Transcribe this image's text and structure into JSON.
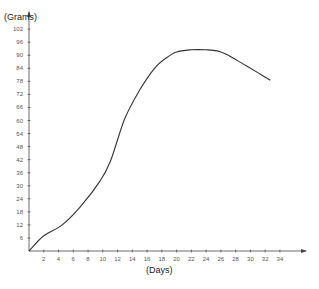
{
  "chart_data": {
    "type": "line",
    "title": "",
    "xlabel": "(Days)",
    "ylabel": "(Grams)",
    "xlim": [
      0,
      36
    ],
    "ylim": [
      0,
      104
    ],
    "grid": false,
    "legend": null,
    "x_ticks": [
      2,
      4,
      6,
      8,
      10,
      12,
      14,
      16,
      18,
      20,
      22,
      24,
      26,
      28,
      30,
      32,
      34
    ],
    "y_ticks": [
      6,
      12,
      18,
      24,
      30,
      36,
      42,
      48,
      54,
      60,
      66,
      72,
      78,
      84,
      90,
      96,
      102
    ],
    "series": [
      {
        "name": "Weight",
        "color": "#333333",
        "x": [
          0,
          2,
          4.5,
          7,
          9.6,
          11,
          13,
          15,
          17,
          18.5,
          20,
          22,
          24,
          25.5,
          27,
          29,
          31,
          32.7
        ],
        "y": [
          0,
          7,
          12,
          20.5,
          32,
          41,
          61,
          74,
          84,
          88.5,
          91.5,
          92.5,
          92.5,
          92,
          90,
          86,
          82,
          78.5
        ]
      }
    ]
  }
}
